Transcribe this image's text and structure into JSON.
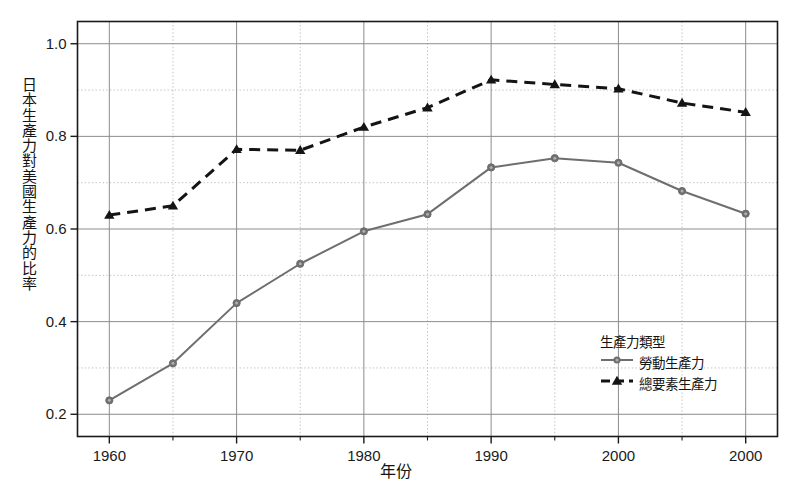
{
  "chart_data": {
    "type": "line",
    "title": "",
    "xlabel": "年份",
    "ylabel": "日本生產力對美國生產力的比率",
    "x": [
      1960,
      1965,
      1970,
      1975,
      1980,
      1985,
      1990,
      1995,
      2000,
      2005,
      2010
    ],
    "xtick_labels": [
      "1960",
      "1970",
      "1980",
      "1990",
      "2000",
      "2000"
    ],
    "xtick_values": [
      1960,
      1970,
      1980,
      1990,
      2000,
      2010
    ],
    "ytick_labels": [
      "0.2",
      "0.4",
      "0.6",
      "0.8",
      "1.0"
    ],
    "ytick_values": [
      0.2,
      0.4,
      0.6,
      0.8,
      1.0
    ],
    "xlim": [
      1957.5,
      2012.5
    ],
    "ylim": [
      0.152,
      1.048
    ],
    "grid": "major and minor dotted gridlines, solid at major y",
    "legend_position": "inside lower right",
    "legend_title": "生產力類型",
    "series": [
      {
        "name": "勞動生產力",
        "color": "#6e6e6e",
        "linestyle": "solid",
        "marker": "circle",
        "values": [
          0.23,
          0.31,
          0.44,
          0.525,
          0.595,
          0.632,
          0.733,
          0.753,
          0.743,
          0.682,
          0.633
        ]
      },
      {
        "name": "總要素生產力",
        "color": "#141414",
        "linestyle": "dashed",
        "marker": "triangle",
        "values": [
          0.63,
          0.65,
          0.772,
          0.77,
          0.82,
          0.862,
          0.922,
          0.912,
          0.903,
          0.872,
          0.852
        ]
      }
    ]
  },
  "axis_title_chars": {
    "y": [
      "日",
      "本",
      "生",
      "產",
      "力",
      "對",
      "美",
      "國",
      "生",
      "產",
      "力",
      "的",
      "比",
      "率"
    ]
  },
  "colors": {
    "frame": "#1a1a1a",
    "grid_major": "#7a7a7a",
    "grid_minor": "#b9b9b9",
    "series_labor": "#6e6e6e",
    "series_tfp": "#141414",
    "background": "#ffffff"
  }
}
